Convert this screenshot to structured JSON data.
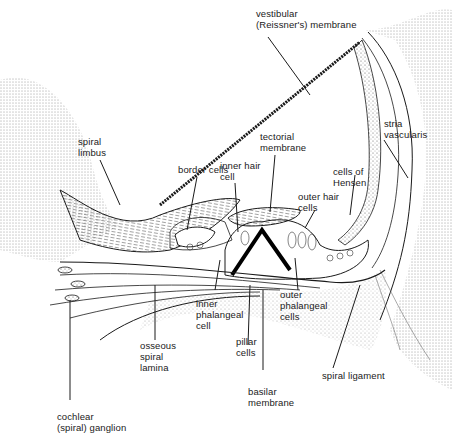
{
  "figure": {
    "ink_color": "#1a1a1a",
    "background": "#ffffff"
  },
  "labels": {
    "vestibular_membrane": "vestibular\n(Reissner's) membrane",
    "stria_vascularis": "stria\nvascularis",
    "spiral_limbus": "spiral\nlimbus",
    "tectorial_membrane": "tectorial\nmembrane",
    "border_cells": "border cells",
    "inner_hair_cell": "inner hair\ncell",
    "cells_of_hensen": "cells of\nHensen",
    "outer_hair_cells": "outer hair\ncells",
    "inner_phalangeal_cell": "inner\nphalangeal\ncell",
    "outer_phalangeal_cells": "outer\nphalangeal\ncells",
    "osseous_spiral_lamina": "osseous\nspiral\nlamina",
    "pillar_cells": "pillar\ncells",
    "spiral_ligament": "spiral ligament",
    "basilar_membrane": "basilar\nmembrane",
    "cochlear_ganglion": "cochlear\n(spiral) ganglion"
  }
}
